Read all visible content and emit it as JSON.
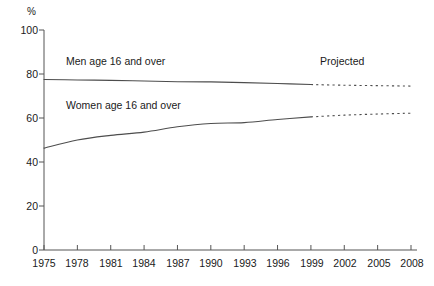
{
  "chart_data": {
    "type": "line",
    "title": "",
    "subtitle": "",
    "xlabel": "",
    "ylabel": "%",
    "unit_label": "%",
    "xlim": [
      1975,
      2008
    ],
    "ylim": [
      0,
      100
    ],
    "grid": false,
    "legend_position": "inline-labels",
    "x_ticks": [
      "1975",
      "1978",
      "1981",
      "1984",
      "1987",
      "1990",
      "1993",
      "1996",
      "1999",
      "2002",
      "2005",
      "2008"
    ],
    "y_ticks": [
      "0",
      "20",
      "40",
      "60",
      "80",
      "100"
    ],
    "projection_start_year": 1999,
    "annotations": [
      {
        "name": "projected-label",
        "text": "Projected",
        "x": 2003,
        "y": 89
      }
    ],
    "series": [
      {
        "name": "Men age 16 and over",
        "label": "Men age 16 and over",
        "color": "#4d4d4d",
        "label_x": 1978,
        "label_y": 84,
        "x": [
          1975,
          1978,
          1981,
          1984,
          1987,
          1990,
          1993,
          1996,
          1999,
          2002,
          2005,
          2008
        ],
        "values": [
          77.5,
          77.3,
          77.1,
          76.8,
          76.5,
          76.4,
          76.1,
          75.7,
          75.2,
          74.9,
          74.7,
          74.5
        ],
        "projected_from_index": 8
      },
      {
        "name": "Women age 16 and over",
        "label": "Women age 16 and over",
        "color": "#4d4d4d",
        "label_x": 1978,
        "label_y": 65,
        "x": [
          1975,
          1978,
          1981,
          1984,
          1987,
          1990,
          1993,
          1996,
          1999,
          2002,
          2005,
          2008
        ],
        "values": [
          46.3,
          50.0,
          52.1,
          53.6,
          56.0,
          57.5,
          57.9,
          59.3,
          60.5,
          61.3,
          61.8,
          62.2
        ],
        "projected_from_index": 8
      }
    ]
  },
  "axes": {
    "y_unit": "%",
    "y_tick_0": "0",
    "y_tick_20": "20",
    "y_tick_40": "40",
    "y_tick_60": "60",
    "y_tick_80": "80",
    "y_tick_100": "100",
    "x_tick_1975": "1975",
    "x_tick_1978": "1978",
    "x_tick_1981": "1981",
    "x_tick_1984": "1984",
    "x_tick_1987": "1987",
    "x_tick_1990": "1990",
    "x_tick_1993": "1993",
    "x_tick_1996": "1996",
    "x_tick_1999": "1999",
    "x_tick_2002": "2002",
    "x_tick_2005": "2005",
    "x_tick_2008": "2008"
  },
  "labels": {
    "men_series": "Men age 16 and over",
    "women_series": "Women age 16 and over",
    "projected": "Projected"
  },
  "colors": {
    "line": "#4d4d4d",
    "axis": "#555555",
    "text": "#1a1a1a",
    "background": "#ffffff"
  }
}
